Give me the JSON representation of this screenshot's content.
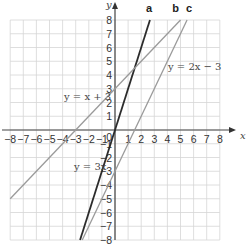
{
  "chart_data": {
    "type": "line",
    "title": "",
    "xlabel": "x",
    "ylabel": "y",
    "xlim": [
      -8,
      8
    ],
    "ylim": [
      -8,
      8
    ],
    "grid": true,
    "x_ticks": [
      -8,
      -7,
      -6,
      -5,
      -4,
      -3,
      -2,
      -1,
      1,
      2,
      3,
      4,
      5,
      6,
      7,
      8
    ],
    "y_ticks": [
      -8,
      -7,
      -6,
      -5,
      -4,
      -3,
      -2,
      -1,
      1,
      2,
      3,
      4,
      5,
      6,
      7,
      8
    ],
    "origin_label": "0",
    "series": [
      {
        "name": "a",
        "equation": "y = 3x",
        "slope": 3,
        "intercept": 0,
        "x": [
          -2.667,
          2.667
        ],
        "y": [
          -8,
          8
        ],
        "color": "#2b2b2b",
        "label_text": "y = 3x"
      },
      {
        "name": "b",
        "equation": "y = x + 3",
        "slope": 1,
        "intercept": 3,
        "x": [
          -8,
          5
        ],
        "y": [
          -5,
          8
        ],
        "color": "#9a9a9a",
        "label_text": "y = x + 3"
      },
      {
        "name": "c",
        "equation": "y = 2x − 3",
        "slope": 2,
        "intercept": -3,
        "x": [
          -2.5,
          5.5
        ],
        "y": [
          -8,
          8
        ],
        "color": "#9a9a9a",
        "label_text": "y = 2x − 3"
      }
    ]
  }
}
